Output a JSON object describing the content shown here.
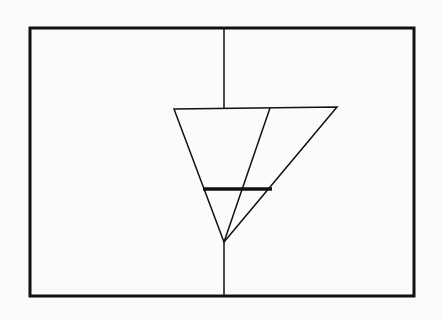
{
  "diagram": {
    "background": "#fbfbfa",
    "ink_color": "#111111",
    "frame": {
      "x": 30,
      "y": 28,
      "width": 384,
      "height": 268,
      "stroke_width": 3
    },
    "vertical_axis": {
      "x": 224,
      "top_segment": {
        "y1": 28,
        "y2": 108
      },
      "bottom_segment": {
        "y1": 242,
        "y2": 296
      },
      "stroke_width": 1.5
    },
    "outer_triangle": {
      "points": [
        [
          174,
          109
        ],
        [
          337,
          107
        ],
        [
          224,
          242
        ]
      ],
      "stroke_width": 1.5
    },
    "inner_line": {
      "from": [
        270,
        108
      ],
      "to": [
        224,
        242
      ],
      "stroke_width": 1.5
    },
    "level_bar": {
      "x1": 203,
      "x2": 272,
      "y": 189,
      "stroke_width": 3.5
    }
  }
}
